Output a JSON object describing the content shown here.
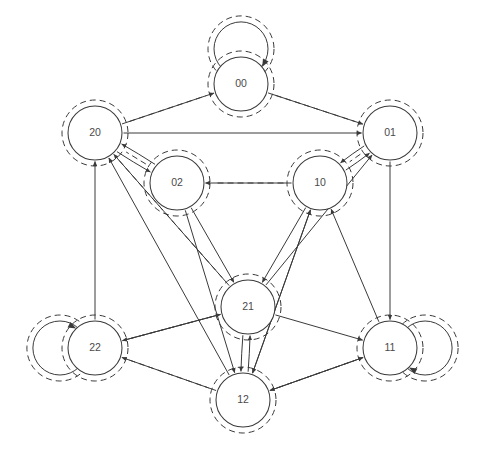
{
  "diagram": {
    "type": "directed-graph",
    "background_color": "#ffffff",
    "stroke_color": "#3a3a3a",
    "label_color": "#4a4a4a",
    "node_radius": 27,
    "nodes": [
      {
        "id": "00",
        "label": "00",
        "cx": 241,
        "cy": 84,
        "self_loop": true,
        "self_loop_dir": "up",
        "highlighted": true
      },
      {
        "id": "20",
        "label": "20",
        "cx": 95,
        "cy": 133,
        "self_loop": false,
        "self_loop_dir": "",
        "highlighted": true
      },
      {
        "id": "01",
        "label": "01",
        "cx": 390,
        "cy": 133,
        "self_loop": false,
        "self_loop_dir": "",
        "highlighted": true
      },
      {
        "id": "02",
        "label": "02",
        "cx": 177,
        "cy": 183,
        "self_loop": false,
        "self_loop_dir": "",
        "highlighted": true
      },
      {
        "id": "10",
        "label": "10",
        "cx": 320,
        "cy": 183,
        "self_loop": false,
        "self_loop_dir": "",
        "highlighted": true
      },
      {
        "id": "21",
        "label": "21",
        "cx": 248,
        "cy": 307,
        "self_loop": false,
        "self_loop_dir": "",
        "highlighted": true
      },
      {
        "id": "22",
        "label": "22",
        "cx": 95,
        "cy": 348,
        "self_loop": true,
        "self_loop_dir": "left",
        "highlighted": true
      },
      {
        "id": "11",
        "label": "11",
        "cx": 390,
        "cy": 348,
        "self_loop": true,
        "self_loop_dir": "right",
        "highlighted": true
      },
      {
        "id": "12",
        "label": "12",
        "cx": 243,
        "cy": 400,
        "self_loop": false,
        "self_loop_dir": "",
        "highlighted": true
      }
    ],
    "edges": [
      {
        "from": "20",
        "to": "00",
        "curve": 0
      },
      {
        "from": "00",
        "to": "01",
        "curve": 0
      },
      {
        "from": "20",
        "to": "01",
        "curve": 0
      },
      {
        "from": "20",
        "to": "02",
        "curve": 5
      },
      {
        "from": "02",
        "to": "20",
        "curve": 5
      },
      {
        "from": "10",
        "to": "02",
        "curve": 0
      },
      {
        "from": "10",
        "to": "01",
        "curve": 5
      },
      {
        "from": "01",
        "to": "10",
        "curve": 5
      },
      {
        "from": "22",
        "to": "20",
        "curve": 0
      },
      {
        "from": "21",
        "to": "20",
        "curve": 0
      },
      {
        "from": "12",
        "to": "20",
        "curve": 0
      },
      {
        "from": "01",
        "to": "11",
        "curve": 0
      },
      {
        "from": "12",
        "to": "10",
        "curve": 0
      },
      {
        "from": "11",
        "to": "10",
        "curve": 0
      },
      {
        "from": "21",
        "to": "01",
        "curve": 0
      },
      {
        "from": "02",
        "to": "21",
        "curve": 0
      },
      {
        "from": "02",
        "to": "12",
        "curve": 0
      },
      {
        "from": "10",
        "to": "21",
        "curve": 0
      },
      {
        "from": "10",
        "to": "12",
        "curve": 0
      },
      {
        "from": "22",
        "to": "21",
        "curve": 0
      },
      {
        "from": "21",
        "to": "22",
        "curve": 0
      },
      {
        "from": "12",
        "to": "22",
        "curve": 0
      },
      {
        "from": "21",
        "to": "11",
        "curve": 0
      },
      {
        "from": "12",
        "to": "11",
        "curve": 0
      },
      {
        "from": "11",
        "to": "12",
        "curve": 0
      },
      {
        "from": "21",
        "to": "12",
        "curve": 4
      },
      {
        "from": "12",
        "to": "21",
        "curve": 4
      }
    ],
    "highlight_path": {
      "style": "dashed",
      "sequence": [
        "20",
        "00",
        "01",
        "10",
        "02",
        "20",
        "21",
        "22",
        "12",
        "11"
      ]
    }
  }
}
